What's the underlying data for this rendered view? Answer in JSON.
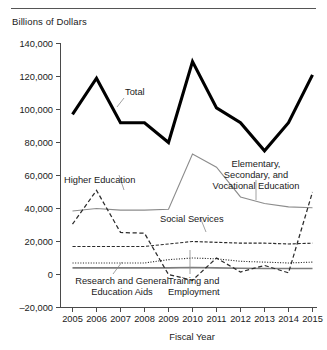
{
  "figure": {
    "y_axis_title": "Billions of Dollars",
    "x_axis_label": "Fiscal Year"
  },
  "chart_data": {
    "type": "line",
    "title": "",
    "xlabel": "Fiscal Year",
    "ylabel": "Billions of Dollars",
    "x": [
      2005,
      2006,
      2007,
      2008,
      2009,
      2010,
      2011,
      2012,
      2013,
      2014,
      2015
    ],
    "xtick_labels": [
      "2005",
      "2006",
      "2007",
      "2008",
      "2009",
      "2010",
      "2011",
      "2012",
      "2013",
      "2014",
      "2015"
    ],
    "ylim": [
      -20000,
      140000
    ],
    "ytick_values": [
      -20000,
      0,
      20000,
      40000,
      60000,
      80000,
      100000,
      120000,
      140000
    ],
    "ytick_labels": [
      "–20,000",
      "0",
      "20,000",
      "40,000",
      "60,000",
      "80,000",
      "100,000",
      "120,000",
      "140,000"
    ],
    "grid": false,
    "legend": "inline-annotations",
    "series": [
      {
        "name": "Total",
        "style": "solid-thick-black",
        "color": "#000000",
        "values": [
          97000,
          119000,
          92000,
          92000,
          80000,
          129000,
          101000,
          92000,
          75000,
          92000,
          121000
        ]
      },
      {
        "name": "Elementary, Secondary, and Vocational Education",
        "style": "solid-thin-gray",
        "color": "#8c8c8c",
        "values": [
          38500,
          40000,
          39000,
          39000,
          39500,
          73000,
          65000,
          47000,
          43000,
          41000,
          40500
        ]
      },
      {
        "name": "Higher Education",
        "style": "long-dashed",
        "color": "#2b2b2b",
        "values": [
          30500,
          51000,
          25500,
          25000,
          0,
          -3500,
          10000,
          1500,
          5500,
          1000,
          50000
        ]
      },
      {
        "name": "Social Services",
        "style": "dash-dot",
        "color": "#2b2b2b",
        "values": [
          17000,
          17000,
          17000,
          17000,
          18500,
          20000,
          19500,
          19000,
          19000,
          18500,
          19000
        ]
      },
      {
        "name": "Training and Employment",
        "style": "dotted",
        "color": "#2b2b2b",
        "values": [
          7000,
          7000,
          7000,
          7000,
          9000,
          10000,
          9500,
          8000,
          7500,
          7000,
          7500
        ]
      },
      {
        "name": "Research and General Education Aids",
        "style": "solid-medium-gray",
        "color": "#7d7d7d",
        "values": [
          4000,
          4000,
          4000,
          4000,
          4000,
          4200,
          4000,
          3800,
          3600,
          3600,
          3600
        ]
      }
    ],
    "annotations": [
      {
        "text": "Total",
        "for": "Total"
      },
      {
        "text": "Elementary,",
        "for": "Elementary, Secondary, and Vocational Education"
      },
      {
        "text": "Secondary, and",
        "for": "Elementary, Secondary, and Vocational Education"
      },
      {
        "text": "Vocational Education",
        "for": "Elementary, Secondary, and Vocational Education"
      },
      {
        "text": "Higher Education",
        "for": "Higher Education"
      },
      {
        "text": "Social Services",
        "for": "Social Services"
      },
      {
        "text": "Research and General",
        "for": "Research and General Education Aids"
      },
      {
        "text": "Education Aids",
        "for": "Research and General Education Aids"
      },
      {
        "text": "Training and",
        "for": "Training and Employment"
      },
      {
        "text": "Employment",
        "for": "Training and Employment"
      }
    ]
  }
}
